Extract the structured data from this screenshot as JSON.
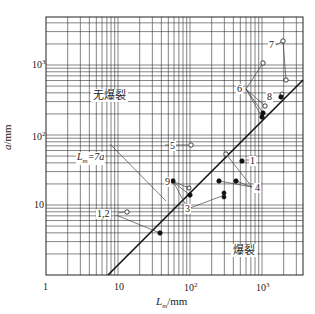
{
  "chart_data": {
    "type": "scatter",
    "title": "",
    "xlabel": "L_m/mm",
    "ylabel": "a/mm",
    "xscale": "log",
    "yscale": "log",
    "xlim": [
      1,
      3700
    ],
    "ylim": [
      1,
      4600
    ],
    "grid": true,
    "x_ticks": [
      "1",
      "10",
      "10^2",
      "10^3"
    ],
    "y_ticks": [
      "10",
      "10^2",
      "10^3"
    ],
    "reference_line": {
      "label": "L_m=7a",
      "equation": "a = L_m / 7"
    },
    "regions": [
      {
        "label": "无爆裂",
        "meaning": "no burst",
        "side": "upper-left"
      },
      {
        "label": "爆裂",
        "meaning": "burst",
        "side": "lower-right"
      }
    ],
    "series": [
      {
        "name": "1,2",
        "points": [
          {
            "x": 13,
            "y": 7.2,
            "marker": "open"
          },
          {
            "x": 42,
            "y": 3.8,
            "marker": "filled"
          }
        ]
      },
      {
        "name": "1",
        "points": [
          {
            "x": 580,
            "y": 43,
            "marker": "filled"
          }
        ]
      },
      {
        "name": "3",
        "points": [
          {
            "x": 140,
            "y": 21,
            "marker": "filled"
          },
          {
            "x": 320,
            "y": 14,
            "marker": "filled"
          },
          {
            "x": 320,
            "y": 12.5,
            "marker": "filled"
          }
        ]
      },
      {
        "name": "4",
        "points": [
          {
            "x": 280,
            "y": 21,
            "marker": "filled"
          },
          {
            "x": 480,
            "y": 21,
            "marker": "filled"
          },
          {
            "x": 320,
            "y": 52,
            "marker": "open"
          }
        ]
      },
      {
        "name": "5",
        "points": [
          {
            "x": 110,
            "y": 75,
            "marker": "open"
          }
        ]
      },
      {
        "name": "6",
        "points": [
          {
            "x": 1100,
            "y": 1100,
            "marker": "open"
          },
          {
            "x": 1150,
            "y": 270,
            "marker": "open"
          },
          {
            "x": 1050,
            "y": 230,
            "marker": "filled"
          },
          {
            "x": 1000,
            "y": 185,
            "marker": "filled"
          }
        ]
      },
      {
        "name": "7",
        "points": [
          {
            "x": 2100,
            "y": 1900,
            "marker": "open"
          },
          {
            "x": 2400,
            "y": 550,
            "marker": "open"
          }
        ]
      },
      {
        "name": "8",
        "points": [
          {
            "x": 2000,
            "y": 380,
            "marker": "filled"
          },
          {
            "x": 2050,
            "y": 400,
            "marker": "open"
          }
        ]
      },
      {
        "name": "9",
        "points": [
          {
            "x": 110,
            "y": 13.5,
            "marker": "filled"
          },
          {
            "x": 120,
            "y": 16.5,
            "marker": "open"
          }
        ]
      }
    ]
  },
  "labels": {
    "x_axis_label": "L",
    "x_axis_sub": "m",
    "x_axis_unit": "/mm",
    "y_axis_label": "a",
    "y_axis_unit": "/mm",
    "region_no_burst": "无爆裂",
    "region_burst": "爆裂",
    "line_label_main": "L",
    "line_label_sub": "m",
    "line_label_rest": "=7a",
    "tick_x_1": "1",
    "tick_x_10": "10",
    "tick_x_100_base": "10",
    "tick_x_100_exp": "2",
    "tick_x_1000_base": "10",
    "tick_x_1000_exp": "3",
    "tick_y_10": "10",
    "tick_y_100_base": "10",
    "tick_y_100_exp": "2",
    "tick_y_1000_base": "10",
    "tick_y_1000_exp": "3",
    "ann_1": "1",
    "ann_12": "1,2",
    "ann_3": "3",
    "ann_4": "4",
    "ann_5": "5",
    "ann_6": "6",
    "ann_7": "7",
    "ann_8": "8",
    "ann_9": "9"
  }
}
